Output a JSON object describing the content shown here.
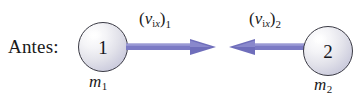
{
  "figure": {
    "caption": "Antes:",
    "background_color": "#ffffff",
    "arrow_color": "#7b7ac4",
    "ball_outline_color": "#3a3a44"
  },
  "objects": [
    {
      "id": "1",
      "ball_number": "1",
      "mass_symbol": "m",
      "mass_subscript": "1",
      "velocity": {
        "open_paren": "(",
        "symbol": "v",
        "sub_i": "i",
        "sub_x": "x",
        "close_paren": ")",
        "index": "1"
      },
      "arrow_direction": "right"
    },
    {
      "id": "2",
      "ball_number": "2",
      "mass_symbol": "m",
      "mass_subscript": "2",
      "velocity": {
        "open_paren": "(",
        "symbol": "v",
        "sub_i": "i",
        "sub_x": "x",
        "close_paren": ")",
        "index": "2"
      },
      "arrow_direction": "left"
    }
  ]
}
